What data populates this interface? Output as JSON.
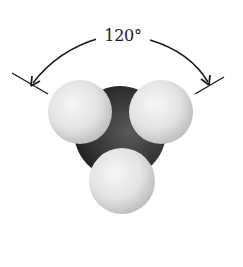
{
  "diagram": {
    "angle_label": "120°",
    "colors": {
      "background": "#ffffff",
      "line": "#1a1a1a",
      "central_atom": "#3a3a3a",
      "outer_atom": "#e6e6e6"
    },
    "atoms": [
      {
        "role": "central",
        "cx": 120,
        "cy": 132,
        "r": 46
      },
      {
        "role": "outer-left",
        "cx": 80,
        "cy": 112,
        "r": 32
      },
      {
        "role": "outer-right",
        "cx": 161,
        "cy": 112,
        "r": 32
      },
      {
        "role": "outer-bottom",
        "cx": 122,
        "cy": 181,
        "r": 33
      }
    ]
  }
}
